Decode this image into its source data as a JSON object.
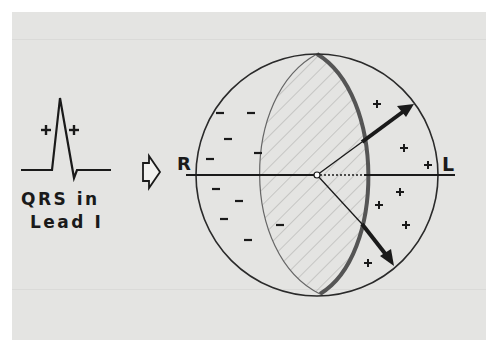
{
  "diagram": {
    "left_panel": {
      "caption_line1": "QRS in",
      "caption_line2": "Lead I",
      "waveform_signs": [
        "+",
        "+"
      ]
    },
    "transition_icon": "hollow-right-arrow",
    "sphere": {
      "left_pole_label": "R",
      "right_pole_label": "L",
      "negative_sign": "−",
      "positive_sign": "+",
      "negative_region": "left hemisphere",
      "positive_region": "right hemisphere",
      "negative_count": 10,
      "positive_count": 7
    },
    "colors": {
      "background": "#e4e4e2",
      "ink": "#1a1a1a",
      "hatch": "#a8a8a6",
      "band": "#555555"
    }
  }
}
